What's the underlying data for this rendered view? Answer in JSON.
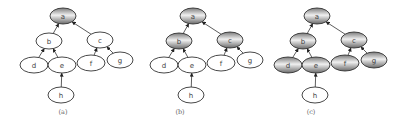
{
  "colors": {
    "stroke": "#333333",
    "plain_fill": "#ffffff",
    "shade_dark": "#7a7a7a",
    "shade_light": "#f0f0f0",
    "label": "#444444",
    "caption": "#666666"
  },
  "tree": {
    "nodes": [
      {
        "id": "a",
        "label": "a",
        "x": 63,
        "y": 16,
        "rx": 13,
        "ry": 8
      },
      {
        "id": "b",
        "label": "b",
        "x": 49,
        "y": 41,
        "rx": 13,
        "ry": 8
      },
      {
        "id": "c",
        "label": "c",
        "x": 100,
        "y": 40,
        "rx": 13,
        "ry": 8
      },
      {
        "id": "d",
        "label": "d",
        "x": 34,
        "y": 65,
        "rx": 14,
        "ry": 8
      },
      {
        "id": "e",
        "label": "e",
        "x": 62,
        "y": 65,
        "rx": 14,
        "ry": 8
      },
      {
        "id": "f",
        "label": "f",
        "x": 91,
        "y": 63,
        "rx": 14,
        "ry": 8
      },
      {
        "id": "g",
        "label": "g",
        "x": 120,
        "y": 60,
        "rx": 13,
        "ry": 8
      },
      {
        "id": "h",
        "label": "h",
        "x": 61,
        "y": 95,
        "rx": 13,
        "ry": 8
      }
    ],
    "edges": [
      {
        "from": "b",
        "to": "a"
      },
      {
        "from": "c",
        "to": "a"
      },
      {
        "from": "d",
        "to": "b"
      },
      {
        "from": "e",
        "to": "b"
      },
      {
        "from": "f",
        "to": "c"
      },
      {
        "from": "g",
        "to": "c"
      },
      {
        "from": "h",
        "to": "e"
      }
    ]
  },
  "panels": [
    {
      "caption": "(a)",
      "offset_x": 0,
      "caption_x": 63,
      "caption_y": 114,
      "shaded": [
        "a"
      ]
    },
    {
      "caption": "(b)",
      "offset_x": 130,
      "caption_x": 180,
      "caption_y": 114,
      "shaded": [
        "a",
        "b",
        "c"
      ]
    },
    {
      "caption": "(c)",
      "offset_x": 254,
      "caption_x": 311,
      "caption_y": 114,
      "shaded": [
        "a",
        "b",
        "c",
        "d",
        "e",
        "f",
        "g"
      ]
    }
  ]
}
